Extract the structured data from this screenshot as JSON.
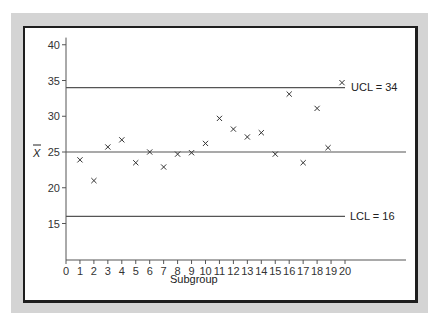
{
  "chart_data": {
    "type": "scatter",
    "title": "",
    "xlabel": "Subgroup",
    "ylabel": "X̄",
    "xlim": [
      0,
      20
    ],
    "ylim": [
      10,
      40
    ],
    "x_ticks": [
      0,
      1,
      2,
      3,
      4,
      5,
      6,
      7,
      8,
      9,
      10,
      11,
      12,
      13,
      14,
      15,
      16,
      17,
      18,
      19,
      20
    ],
    "y_ticks": [
      15,
      20,
      25,
      30,
      35,
      40
    ],
    "grid": false,
    "marker": "x",
    "x": [
      1,
      2,
      3,
      4,
      5,
      6,
      7,
      8,
      9,
      10,
      11,
      12,
      13,
      14,
      15,
      16,
      17,
      18,
      19,
      20
    ],
    "values": [
      23.9,
      21.0,
      25.7,
      26.7,
      23.5,
      25.0,
      22.9,
      24.7,
      24.9,
      26.2,
      29.7,
      28.2,
      27.1,
      27.7,
      24.7,
      33.1,
      23.5,
      31.1,
      25.6,
      34.7
    ],
    "reference_lines": [
      {
        "name": "UCL",
        "value": 34,
        "label": "UCL = 34"
      },
      {
        "name": "Center",
        "value": 25,
        "label": ""
      },
      {
        "name": "LCL",
        "value": 16,
        "label": "LCL = 16"
      }
    ]
  },
  "labels": {
    "ucl": "UCL = 34",
    "lcl": "LCL = 16",
    "xlabel": "Subgroup",
    "ylabel": "X"
  },
  "colors": {
    "panel": "#d4d4d4",
    "frame_border": "#1e1e1e",
    "lines": "#555555",
    "markers": "#333333"
  }
}
